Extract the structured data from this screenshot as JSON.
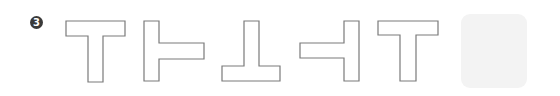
{
  "question": {
    "number_label": "3",
    "badge_color": "#3a3a3a",
    "badge_text_color": "#ffffff"
  },
  "sequence": {
    "description": "T-shaped figure rotated 90 degrees clockwise each step",
    "stroke_color": "#7a7a7a",
    "fill_color": "#ffffff",
    "items": [
      {
        "orientation": "up",
        "rotation_deg": 0
      },
      {
        "orientation": "right",
        "rotation_deg": 90
      },
      {
        "orientation": "down",
        "rotation_deg": 180
      },
      {
        "orientation": "left",
        "rotation_deg": 270
      },
      {
        "orientation": "up",
        "rotation_deg": 360
      }
    ]
  },
  "answer_slot": {
    "state": "empty",
    "background_color": "#f3f3f3"
  }
}
